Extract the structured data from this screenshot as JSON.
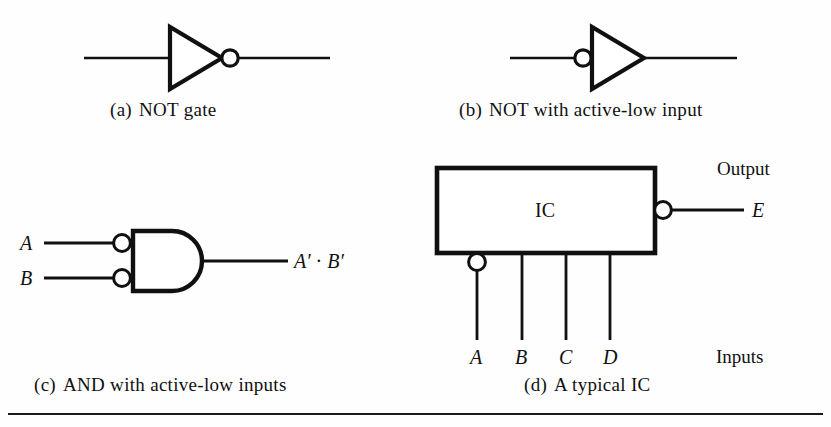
{
  "figure": {
    "background_color": "#fefefe",
    "ink_color": "#101010",
    "rule_color": "#1a1a1a"
  },
  "panels": [
    {
      "id": "a",
      "tag": "(a)",
      "caption": "NOT gate",
      "symbol": "not-gate",
      "bubble_side": "output",
      "inputs": [],
      "outputs": []
    },
    {
      "id": "b",
      "tag": "(b)",
      "caption": "NOT with active-low input",
      "symbol": "not-gate",
      "bubble_side": "input",
      "inputs": [],
      "outputs": []
    },
    {
      "id": "c",
      "tag": "(c)",
      "caption": "AND with active-low inputs",
      "symbol": "and-gate",
      "bubble_side": "inputs",
      "inputs": [
        "A",
        "B"
      ],
      "outputs": [
        "A' · B'"
      ]
    },
    {
      "id": "d",
      "tag": "(d)",
      "caption": "A typical IC",
      "symbol": "ic-block",
      "block_label": "IC",
      "inputs": [
        "A",
        "B",
        "C",
        "D"
      ],
      "outputs": [
        "E"
      ],
      "input_group_label": "Inputs",
      "output_group_label": "Output",
      "bubbled_inputs": [
        "A"
      ],
      "bubbled_outputs": [
        "E"
      ]
    }
  ],
  "labels": {
    "and_input_a": "A",
    "and_input_b": "B",
    "and_output_var_a": "A",
    "and_output_prime_a": "′",
    "and_output_operator": "·",
    "and_output_var_b": "B",
    "and_output_prime_b": "′",
    "ic_label": "IC",
    "ic_input_a": "A",
    "ic_input_b": "B",
    "ic_input_c": "C",
    "ic_input_d": "D",
    "ic_output_e": "E",
    "ic_output_group": "Output",
    "ic_input_group": "Inputs"
  },
  "captions": {
    "a_tag": "(a)",
    "a_text": "NOT gate",
    "b_tag": "(b)",
    "b_text": "NOT with active-low input",
    "c_tag": "(c)",
    "c_text": "AND with active-low inputs",
    "d_tag": "(d)",
    "d_text": "A typical IC"
  }
}
